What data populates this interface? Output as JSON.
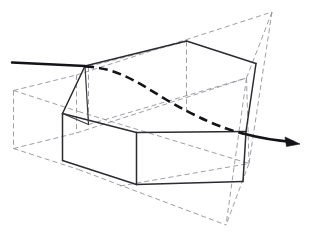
{
  "figure": {
    "canvas": {
      "width": 315,
      "height": 235,
      "background": "#ffffff"
    },
    "styles": {
      "solid_edge_color": "#2b2b30",
      "construction_line_color": "#8d8d93",
      "ray_color": "#141418",
      "construction_dash_pattern": "5 3.2",
      "ray_hidden_dash_pattern": "9 5"
    },
    "labels": {
      "solid_body": "inner-solid-prism",
      "wireframe_body": "outer-construction-wireframe",
      "ray": "traversing-ray",
      "arrow": "ray-direction-arrowhead"
    },
    "geometry": {
      "construction_dashed_paths": [
        "M 13.5 90.5 L 13.5 148.5",
        "M 13.5 90.5 L 76.5 75.0",
        "M 13.5 148.5 L 76.5 133.0",
        "M 76.5 75.0 L 76.5 133.0",
        "M 13.5 90.5 L 78.5 111.5",
        "M 13.5 148.5 L 78.5 169.5",
        "M 76.5 75.0 L 272.0 12.0",
        "M 76.5 133.0 L 246.5 78.0",
        "M 78.5 111.5 L 249.0 163.5",
        "M 78.5 169.5 L 226.0 225.0",
        "M 272.0 12.0 L 246.5 78.0",
        "M 272.0 12.0 L 249.0 163.5",
        "M 246.5 78.0 L 249.0 163.5",
        "M 249.0 163.5 L 226.0 225.0",
        "M 246.5 78.0 L 226.0 225.0",
        "M 186.5 41.5 L 186.5 112.5",
        "M 88.5 66.5 L 88.5 124.5",
        "M 88.5 124.5 L 246.5 78.0",
        "M 88.5 66.5 L 186.5 41.5",
        "M 120.0 186.0 L 249.0 163.5"
      ],
      "solid_edges": [
        "M 85.0 66.0 L 186.5 41.0",
        "M 186.5 41.0 L 256.0 63.5",
        "M 256.0 63.5 L 246.0 131.5",
        "M 85.0 66.0 L 62.5 113.5",
        "M 62.5 113.5 L 62.5 160.5",
        "M 62.5 113.5 L 136.5 132.5",
        "M 136.5 132.5 L 246.0 131.5",
        "M 136.5 132.5 L 136.5 184.5",
        "M 62.5 160.5 L 136.5 184.5",
        "M 136.5 184.5 L 243.0 181.5",
        "M 243.0 181.5 L 246.0 131.5",
        "M 85.0 66.0 L 88.5 124.5",
        "M 88.5 124.5 L 62.5 113.5"
      ],
      "ray": {
        "visible_entry": "M 12.0 62.5 L 85.0 66.0",
        "hidden_segment": "M 85.0 66.5 C 118.0 67.5 140.0 84.0 166.0 99.5 C 196.0 117.0 222.0 128.5 243.0 133.5",
        "visible_exit": "M 243.0 133.5 C 258.0 137.5 275.0 140.5 293.0 142.0",
        "arrow_tip": [
          300.0,
          144.0
        ],
        "arrow_back_upper": [
          285.0,
          137.0
        ],
        "arrow_back_lower": [
          286.5,
          146.5
        ]
      }
    }
  }
}
